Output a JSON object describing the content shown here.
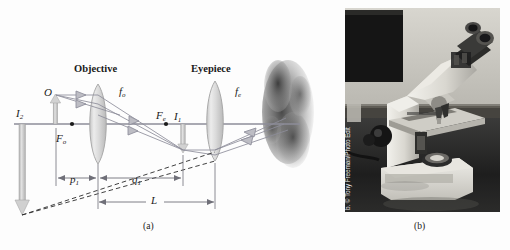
{
  "figure": {
    "panel_a_caption": "(a)",
    "panel_b_caption": "(b)",
    "background_color": "#fdfdfd"
  },
  "diagram": {
    "labels": {
      "objective": "Objective",
      "eyepiece": "Eyepiece",
      "focal_objective": "f",
      "focal_objective_sub": "o",
      "focal_eyepiece": "f",
      "focal_eyepiece_sub": "e",
      "object": "O",
      "image_one": "I",
      "image_one_sub": "1",
      "image_two": "I",
      "image_two_sub": "2",
      "focus_point_objective": "F",
      "focus_point_objective_sub": "o",
      "focus_point_eyepiece": "F",
      "focus_point_eyepiece_sub": "e",
      "distance_p1": "p",
      "distance_p1_sub": "1",
      "distance_q1": "q",
      "distance_q1_sub": "1",
      "tube_length": "L"
    },
    "colors": {
      "ray_line": "#8d8d99",
      "axis_line": "#8d8d99",
      "arrow_fill": "#c9c9c9",
      "arrow_stroke": "#9a9a9a",
      "lens_fill": "#dcdcdc",
      "lens_stroke": "#a8a8a8",
      "dimension_line": "#6f6f78",
      "dashed_line": "#2a2a2a",
      "text": "#1a1a1a"
    },
    "geometry": {
      "axis_y": 124,
      "objective_x": 98,
      "eyepiece_x": 215,
      "object_x": 56,
      "image1_x": 183,
      "image2_x": 22,
      "focus_o_x": 72,
      "focus_e_x": 166
    }
  },
  "photo": {
    "subject": "compound optical microscope on a laboratory bench",
    "credit": "b. © Tony Freeman/Photo Edit"
  }
}
